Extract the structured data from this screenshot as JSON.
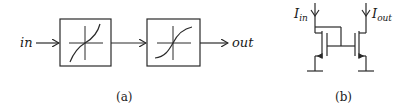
{
  "figure": {
    "panel_a": {
      "caption": "(a)",
      "input_label": "in",
      "output_label": "out",
      "blocks": [
        {
          "name": "expansive-nonlinearity",
          "curve": "expansive"
        },
        {
          "name": "compressive-nonlinearity",
          "curve": "compressive"
        }
      ]
    },
    "panel_b": {
      "caption": "(b)",
      "input_current": {
        "base": "I",
        "sub": "in"
      },
      "output_current": {
        "base": "I",
        "sub": "out"
      }
    }
  },
  "colors": {
    "stroke": "#2a2a2a",
    "background": "#ffffff"
  }
}
